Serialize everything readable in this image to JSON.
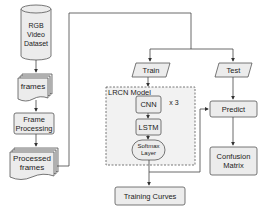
{
  "diagram": {
    "nodes": {
      "dataset": {
        "label_lines": [
          "RGB",
          "Video",
          "Dataset"
        ],
        "shape": "cylinder"
      },
      "frames": {
        "label": "frames",
        "shape": "multi-document"
      },
      "frame_processing": {
        "label_lines": [
          "Frame",
          "Processing"
        ],
        "shape": "rounded-rect"
      },
      "processed_frames": {
        "label_lines": [
          "Processed",
          "frames"
        ],
        "shape": "multi-document"
      },
      "train": {
        "label": "Train",
        "shape": "parallelogram"
      },
      "test": {
        "label": "Test",
        "shape": "parallelogram"
      },
      "lrcn_model": {
        "label": "LRCN Model",
        "shape": "dashed-group"
      },
      "cnn": {
        "label": "CNN",
        "shape": "rounded-rect"
      },
      "repeat": {
        "label": "x 3"
      },
      "lstm": {
        "label": "LSTM",
        "shape": "rounded-rect"
      },
      "softmax": {
        "label_lines": [
          "Softmax",
          "Layer"
        ],
        "shape": "stadium"
      },
      "training_curves": {
        "label": "Training Curves",
        "shape": "rounded-rect"
      },
      "predict": {
        "label": "Predict",
        "shape": "rounded-rect"
      },
      "confusion_matrix": {
        "label_lines": [
          "Confusion",
          "Matrix"
        ],
        "shape": "rounded-rect"
      }
    },
    "edges": [
      [
        "dataset",
        "frames"
      ],
      [
        "frames",
        "frame_processing"
      ],
      [
        "frame_processing",
        "processed_frames"
      ],
      [
        "processed_frames",
        "train"
      ],
      [
        "processed_frames",
        "test"
      ],
      [
        "train",
        "lrcn_model"
      ],
      [
        "cnn",
        "lstm"
      ],
      [
        "lstm",
        "softmax"
      ],
      [
        "softmax",
        "training_curves"
      ],
      [
        "softmax",
        "predict"
      ],
      [
        "test",
        "predict"
      ],
      [
        "predict",
        "confusion_matrix"
      ]
    ],
    "colors": {
      "stroke": "#444444",
      "fill": "#ececec",
      "group_fill": "#f2f2f2",
      "background": "#ffffff"
    }
  }
}
